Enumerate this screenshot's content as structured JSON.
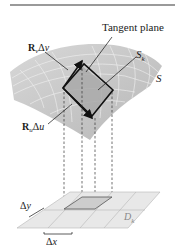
{
  "figure": {
    "labels": {
      "tangent_plane": "Tangent plane",
      "rv_bold": "R",
      "rv_sub": "v",
      "rv_delta": "Δ",
      "rv_var": "v",
      "sk_main": "S",
      "sk_sub": "k",
      "s": "S",
      "ru_bold": "R",
      "ru_sub": "u",
      "ru_delta": "Δ",
      "ru_var": "u",
      "dy_delta": "Δ",
      "dy_var": "y",
      "dx_delta": "Δ",
      "dx_var": "x",
      "dk_main": "D",
      "dk_sub": "k"
    },
    "colors": {
      "surface": "#c9c9c9",
      "surface_grid": "#f2f2f2",
      "patch": "#a8a8a8",
      "outline": "#111111",
      "plane": "#e6e6e6",
      "plane_grid": "#b0b0b0",
      "domain_cell": "#cfcfcf",
      "top_strip": "#9a9a9a"
    }
  }
}
